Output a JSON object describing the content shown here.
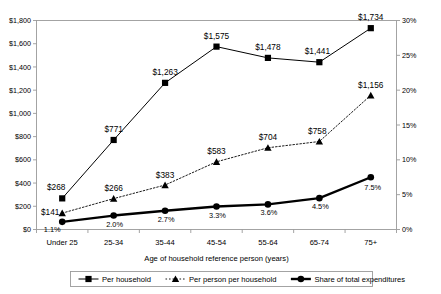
{
  "chart_data": {
    "type": "line",
    "title": "",
    "xlabel": "Age of household reference person (years)",
    "ylabel": "",
    "categories": [
      "Under 25",
      "25-34",
      "35-44",
      "45-54",
      "55-64",
      "65-74",
      "75+"
    ],
    "ylim": [
      0,
      1800
    ],
    "ylim_right": [
      0,
      30
    ],
    "yticks": [
      "$0",
      "$200",
      "$400",
      "$600",
      "$800",
      "$1,000",
      "$1,200",
      "$1,400",
      "$1,600",
      "$1,800"
    ],
    "ytick_values": [
      0,
      200,
      400,
      600,
      800,
      1000,
      1200,
      1400,
      1600,
      1800
    ],
    "yticks_right": [
      "0%",
      "5%",
      "10%",
      "15%",
      "20%",
      "25%",
      "30%"
    ],
    "ytick_values_right": [
      0,
      5,
      10,
      15,
      20,
      25,
      30
    ],
    "grid": false,
    "legend_position": "bottom",
    "series": [
      {
        "name": "Per household",
        "axis": "left",
        "marker": "square",
        "line": "solid",
        "values": [
          268,
          771,
          1263,
          1575,
          1478,
          1441,
          1734
        ],
        "labels": [
          "$268",
          "$771",
          "$1,263",
          "$1,575",
          "$1,478",
          "$1,441",
          "$1,734"
        ]
      },
      {
        "name": "Per person per household",
        "axis": "left",
        "marker": "triangle",
        "line": "dotted",
        "values": [
          141,
          266,
          383,
          583,
          704,
          758,
          1156
        ],
        "labels": [
          "$141",
          "$266",
          "$383",
          "$583",
          "$704",
          "$758",
          "$1,156"
        ]
      },
      {
        "name": "Share of total expenditures",
        "axis": "right",
        "marker": "circle",
        "line": "thick",
        "values": [
          1.1,
          2.0,
          2.7,
          3.3,
          3.6,
          4.5,
          7.5
        ],
        "labels": [
          "1.1%",
          "2.0%",
          "2.7%",
          "3.3%",
          "3.6%",
          "4.5%",
          "7.5%"
        ]
      }
    ]
  },
  "colors": {
    "line": "#000000",
    "axis": "#9a9a9a",
    "plot_bg": "#ffffff",
    "legend_border": "#9a9a9a"
  }
}
